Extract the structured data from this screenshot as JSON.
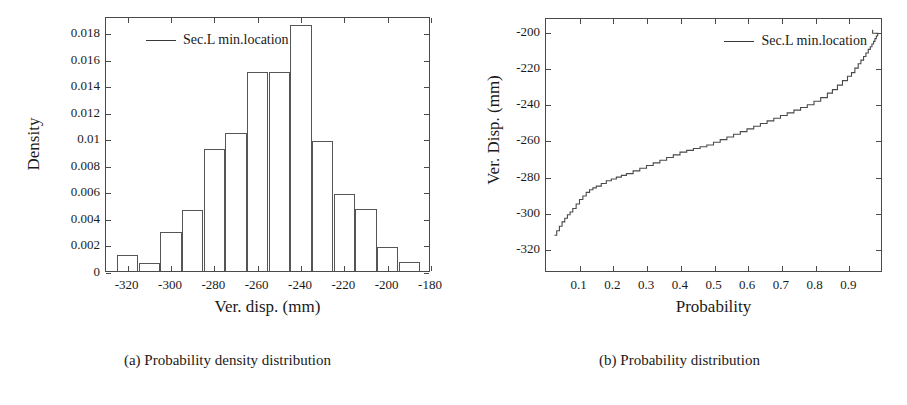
{
  "figure": {
    "panels": [
      {
        "id": "a",
        "caption": "(a) Probability density distribution",
        "legend_label": "Sec.L min.location",
        "legend_position": "top-left"
      },
      {
        "id": "b",
        "caption": "(b) Probability distribution",
        "legend_label": "Sec.L min.location",
        "legend_position": "top-right"
      }
    ]
  },
  "chart_data": [
    {
      "type": "bar",
      "title": "",
      "subtitle": "",
      "xlabel": "Ver. disp. (mm)",
      "ylabel": "Density",
      "xlim": [
        -330,
        -180
      ],
      "ylim": [
        0,
        0.0192
      ],
      "grid": false,
      "legend": [
        "Sec.L min.location"
      ],
      "legend_position": "top-left",
      "xticks": [
        -320,
        -300,
        -280,
        -260,
        -240,
        -220,
        -200,
        -180
      ],
      "xticklabels": [
        "-320",
        "-300",
        "-280",
        "-260",
        "-240",
        "-220",
        "-200",
        "-180"
      ],
      "yticks": [
        0,
        0.002,
        0.004,
        0.006,
        0.008,
        0.01,
        0.012,
        0.014,
        0.016,
        0.018
      ],
      "yticklabels": [
        "0",
        "0.002",
        "0.004",
        "0.006",
        "0.008",
        "0.01",
        "0.012",
        "0.014",
        "0.016",
        "0.018"
      ],
      "bin_width": 10,
      "bin_edges": [
        -325,
        -315,
        -305,
        -295,
        -285,
        -275,
        -265,
        -255,
        -245,
        -235,
        -225,
        -215,
        -205,
        -195,
        -185
      ],
      "bin_centers": [
        -320,
        -310,
        -300,
        -290,
        -280,
        -270,
        -260,
        -250,
        -240,
        -230,
        -220,
        -210,
        -200,
        -190
      ],
      "values": [
        0.0012,
        0.0006,
        0.0029,
        0.0046,
        0.0092,
        0.0104,
        0.015,
        0.015,
        0.0185,
        0.0098,
        0.0058,
        0.0047,
        0.0018,
        0.0007
      ]
    },
    {
      "type": "line",
      "title": "",
      "subtitle": "",
      "xlabel": "Probability",
      "ylabel": "Ver. Disp. (mm)",
      "xlim": [
        0,
        1.0
      ],
      "ylim": [
        -333,
        -192
      ],
      "grid": false,
      "legend": [
        "Sec.L min.location"
      ],
      "legend_position": "top-right",
      "xticks": [
        0.1,
        0.2,
        0.3,
        0.4,
        0.5,
        0.6,
        0.7,
        0.8,
        0.9
      ],
      "xticklabels": [
        "0.1",
        "0.2",
        "0.3",
        "0.4",
        "0.5",
        "0.6",
        "0.7",
        "0.8",
        "0.9"
      ],
      "yticks": [
        -200,
        -220,
        -240,
        -260,
        -280,
        -300,
        -320
      ],
      "yticklabels": [
        "-200",
        "-220",
        "-240",
        "-260",
        "-280",
        "-300",
        "-320"
      ],
      "series": [
        {
          "name": "Sec.L min.location",
          "x": [
            0.025,
            0.032,
            0.04,
            0.048,
            0.056,
            0.064,
            0.072,
            0.08,
            0.09,
            0.1,
            0.11,
            0.12,
            0.13,
            0.14,
            0.15,
            0.165,
            0.18,
            0.195,
            0.21,
            0.225,
            0.24,
            0.26,
            0.28,
            0.3,
            0.32,
            0.34,
            0.36,
            0.38,
            0.4,
            0.42,
            0.44,
            0.46,
            0.48,
            0.5,
            0.52,
            0.54,
            0.56,
            0.58,
            0.6,
            0.62,
            0.64,
            0.66,
            0.68,
            0.7,
            0.72,
            0.74,
            0.76,
            0.78,
            0.8,
            0.82,
            0.84,
            0.855,
            0.87,
            0.885,
            0.9,
            0.912,
            0.922,
            0.932,
            0.94,
            0.948,
            0.955,
            0.962,
            0.968,
            0.973,
            0.978,
            0.982,
            0.986,
            0.99,
            0.975
          ],
          "y": [
            -313.0,
            -310.5,
            -308.0,
            -305.5,
            -303.5,
            -301.5,
            -300.0,
            -298.0,
            -295.5,
            -293.0,
            -291.0,
            -289.0,
            -287.5,
            -286.5,
            -285.5,
            -284.0,
            -282.5,
            -281.5,
            -280.5,
            -279.5,
            -278.5,
            -277.0,
            -275.5,
            -274.0,
            -272.5,
            -271.0,
            -269.5,
            -268.0,
            -266.5,
            -265.5,
            -264.5,
            -263.5,
            -262.5,
            -261.0,
            -259.5,
            -258.0,
            -256.5,
            -255.0,
            -253.5,
            -252.0,
            -250.5,
            -249.0,
            -247.5,
            -246.0,
            -244.5,
            -243.0,
            -241.5,
            -240.0,
            -238.0,
            -236.0,
            -233.5,
            -231.5,
            -229.0,
            -226.5,
            -224.0,
            -222.0,
            -219.5,
            -217.0,
            -215.0,
            -213.0,
            -211.0,
            -209.0,
            -207.5,
            -206.0,
            -204.5,
            -203.0,
            -201.5,
            -200.0,
            -198.0
          ]
        }
      ]
    }
  ]
}
